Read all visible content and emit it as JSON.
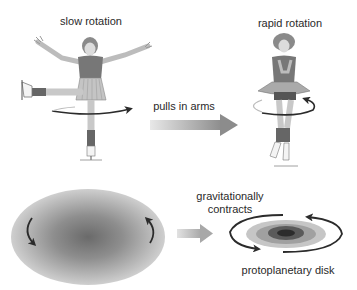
{
  "top_panel": {
    "slow_label": "slow rotation",
    "fast_label": "rapid rotation",
    "arrow_label": "pulls in arms"
  },
  "bottom_panel": {
    "arrow_label_line1": "gravitationally",
    "arrow_label_line2": "contracts",
    "disk_label": "protoplanetary disk"
  },
  "icons": {
    "skater_slow": "skater-arms-out-icon",
    "skater_fast": "skater-arms-in-icon",
    "cloud": "gas-cloud-icon",
    "disk": "protoplanetary-disk-icon"
  },
  "colors": {
    "text": "#2a2a2a",
    "arrow_dark": "#2b2b2b",
    "skin": "#d9d9d9",
    "shirt": "#7a7a7a",
    "cloud_center": "#6a6a6a",
    "cloud_edge": "#c8c8c8"
  }
}
